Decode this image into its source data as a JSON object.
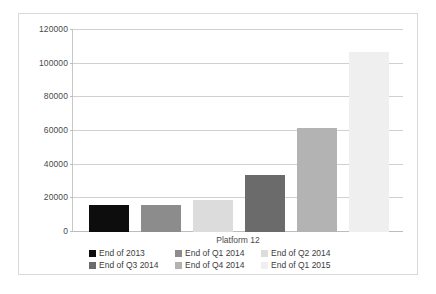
{
  "chart_data": {
    "type": "bar",
    "title": "",
    "xlabel": "Platform 12",
    "ylabel": "",
    "categories": [
      "End of 2013",
      "End of Q1 2014",
      "End of Q2 2014",
      "End of Q3 2014",
      "End of Q4 2014",
      "End of Q1 2015"
    ],
    "values": [
      16000,
      16200,
      19200,
      33800,
      61500,
      106800
    ],
    "ylim": [
      0,
      120000
    ],
    "yticks": [
      0,
      20000,
      40000,
      60000,
      80000,
      100000,
      120000
    ],
    "ytick_labels": [
      "0",
      "20000",
      "40000",
      "60000",
      "80000",
      "100000",
      "120000"
    ],
    "grid": true,
    "legend_position": "bottom",
    "colors": [
      "#0d0d0d",
      "#8c8c8c",
      "#dcdcdc",
      "#6b6b6b",
      "#b3b3b3",
      "#efefef"
    ]
  },
  "legend": {
    "rows": [
      [
        {
          "label": "End of 2013",
          "color": "#0d0d0d"
        },
        {
          "label": "End of Q1 2014",
          "color": "#8c8c8c"
        },
        {
          "label": "End of Q2 2014",
          "color": "#dcdcdc"
        }
      ],
      [
        {
          "label": "End of Q3 2014",
          "color": "#6b6b6b"
        },
        {
          "label": "End of Q4 2014",
          "color": "#b3b3b3"
        },
        {
          "label": "End of Q1 2015",
          "color": "#efefef"
        }
      ]
    ]
  }
}
